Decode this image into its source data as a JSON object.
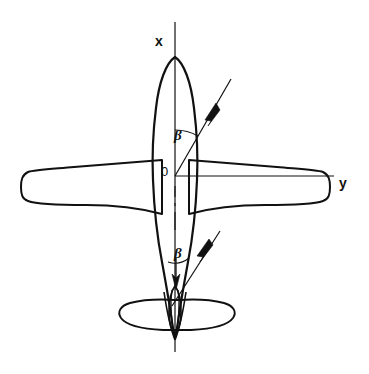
{
  "figure": {
    "type": "technical-line-diagram",
    "background_color": "#ffffff",
    "line_color": "#111111"
  },
  "axes": {
    "x": {
      "label": "x",
      "orientation": "vertical",
      "direction": "forward-up",
      "line": {
        "x1": 175,
        "y1": 22,
        "x2": 175,
        "y2": 352
      }
    },
    "y": {
      "label": "y",
      "orientation": "horizontal",
      "direction": "right",
      "line": {
        "x1": 175,
        "y1": 176,
        "x2": 334,
        "y2": 176
      }
    },
    "origin": {
      "label": "0",
      "x": 175,
      "y": 176
    }
  },
  "annotations": {
    "beta_upper": {
      "label": "β",
      "meaning": "sideslip-angle",
      "arc": {
        "cx": 175,
        "cy": 176,
        "radius": 46,
        "start_deg": 90,
        "end_deg": 60
      },
      "ray": {
        "x1": 175,
        "y1": 176,
        "x2": 229,
        "y2": 82
      },
      "arrow_at": {
        "x": 212,
        "y": 112
      },
      "arrow_direction": "up-right"
    },
    "beta_lower": {
      "label": "β",
      "meaning": "sideslip-angle",
      "arc": {
        "cx": 177,
        "cy": 296,
        "radius": 40,
        "start_deg": 90,
        "end_deg": 62
      },
      "ray": {
        "x1": 177,
        "y1": 296,
        "x2": 217,
        "y2": 238
      },
      "arrow_at": {
        "x": 209,
        "y": 249
      },
      "arrow_direction": "up-right",
      "down_arrow": {
        "x": 177,
        "y1": 258,
        "y2": 286,
        "direction": "down"
      }
    }
  },
  "aircraft": {
    "view": "plan-top-down",
    "parts": [
      {
        "name": "fuselage",
        "description": "slender lens-shaped body, nose up at x-axis, tapering to tail"
      },
      {
        "name": "left-wing",
        "description": "swept trapezoidal wing extending left to tip"
      },
      {
        "name": "right-wing",
        "description": "swept trapezoidal wing extending right to tip"
      },
      {
        "name": "horizontal-stabilizer",
        "description": "oval tailplane near aft fuselage"
      },
      {
        "name": "vertical-fin",
        "description": "narrow centerline fin over tail"
      },
      {
        "name": "centerline-dashes",
        "description": "broken centerline through aft fuselage"
      }
    ],
    "nose": {
      "x": 175,
      "y": 57
    },
    "tail": {
      "x": 175,
      "y": 336
    },
    "left_wing_tip_x": 22,
    "right_wing_tip_x": 326,
    "wing_span_y_center": 184
  }
}
